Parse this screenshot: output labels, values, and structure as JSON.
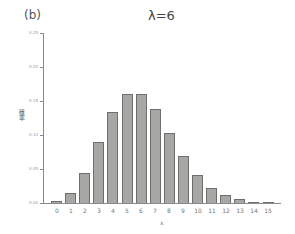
{
  "panel_label": "(b)",
  "chart_data": {
    "type": "bar",
    "title": "λ=6",
    "xlabel": "x",
    "ylabel": "確率",
    "categories": [
      "0",
      "1",
      "2",
      "3",
      "4",
      "5",
      "6",
      "7",
      "8",
      "9",
      "10",
      "11",
      "12",
      "13",
      "14",
      "15"
    ],
    "values": [
      0.0025,
      0.0149,
      0.0446,
      0.0892,
      0.1339,
      0.1606,
      0.1606,
      0.1377,
      0.1033,
      0.0688,
      0.0413,
      0.0225,
      0.0113,
      0.0052,
      0.0022,
      0.0009
    ],
    "ylim": [
      0,
      0.25
    ],
    "yticks": [
      "0.00",
      "0.05",
      "0.10",
      "0.15",
      "0.20",
      "0.25"
    ],
    "grid": false,
    "legend": null,
    "bar_color": "#a7a8a3",
    "bar_edge_color": "#6e6e6e"
  }
}
